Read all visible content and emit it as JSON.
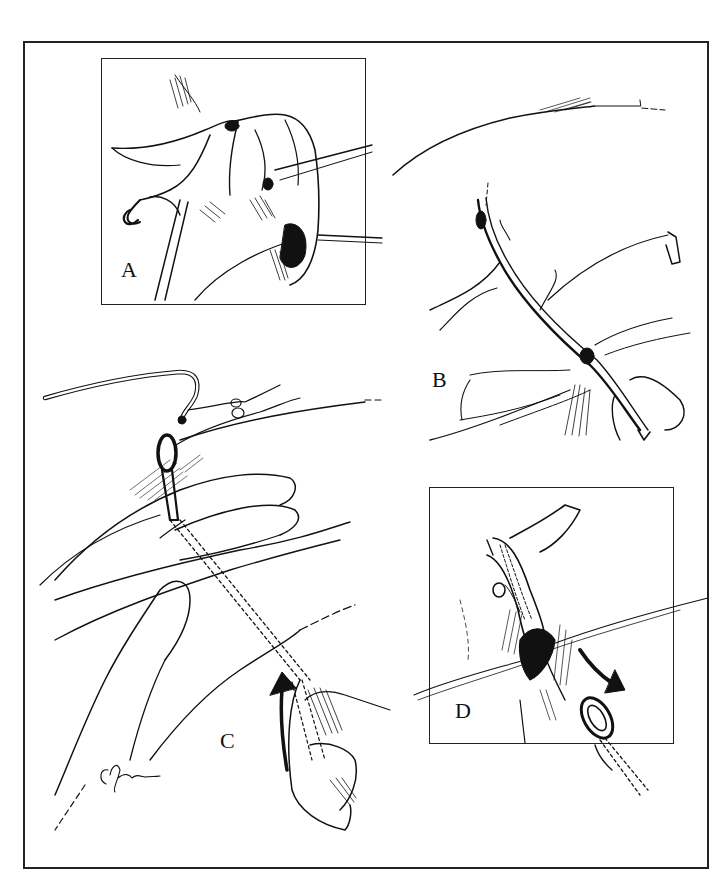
{
  "figure": {
    "type": "surgical line illustration",
    "colors": {
      "ink": "#111111",
      "background": "#ffffff",
      "frame": "#222222"
    },
    "panels": [
      {
        "id": "A",
        "label": "A",
        "boxed": true,
        "content": "exposure with retractors and forceps holding tissue"
      },
      {
        "id": "B",
        "label": "B",
        "boxed": false,
        "content": "branching duct/vessel with dark nodes, held by fingers"
      },
      {
        "id": "C",
        "label": "C",
        "boxed": false,
        "content": "hand guiding looped catheter under skin; curved arrow"
      },
      {
        "id": "D",
        "label": "D",
        "boxed": true,
        "content": "vessel with suture threads and looped instrument; curved arrow"
      }
    ],
    "signature": {
      "visible": true,
      "legible": false
    }
  }
}
